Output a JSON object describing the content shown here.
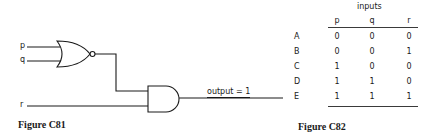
{
  "figure_c81": {
    "caption": "Figure C81",
    "inputs": {
      "p": "p",
      "q": "q",
      "r": "r"
    },
    "gates": [
      {
        "type": "NOR",
        "inputs": [
          "p",
          "q"
        ]
      },
      {
        "type": "AND",
        "inputs": [
          "NOR output",
          "r"
        ]
      }
    ],
    "output_label": "output = 1"
  },
  "figure_c82": {
    "caption": "Figure C82",
    "group_header": "inputs",
    "columns": [
      "p",
      "q",
      "r"
    ],
    "rows": [
      {
        "label": "A",
        "values": [
          "0",
          "0",
          "0"
        ]
      },
      {
        "label": "B",
        "values": [
          "0",
          "0",
          "1"
        ]
      },
      {
        "label": "C",
        "values": [
          "1",
          "0",
          "0"
        ]
      },
      {
        "label": "D",
        "values": [
          "1",
          "1",
          "0"
        ]
      },
      {
        "label": "E",
        "values": [
          "1",
          "1",
          "1"
        ]
      }
    ]
  }
}
